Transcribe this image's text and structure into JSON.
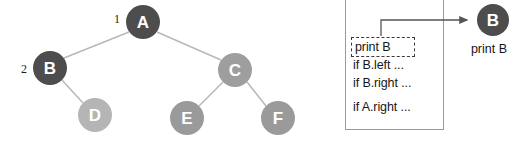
{
  "diagram": {
    "background_color": "#ffffff"
  },
  "tree": {
    "nodes": [
      {
        "id": "A",
        "label": "A",
        "cx": 143,
        "cy": 22,
        "r": 17,
        "color": "#4d4d4d",
        "state": "visited"
      },
      {
        "id": "B",
        "label": "B",
        "cx": 50,
        "cy": 68,
        "r": 17,
        "color": "#4d4d4d",
        "state": "visited"
      },
      {
        "id": "C",
        "label": "C",
        "cx": 235,
        "cy": 70,
        "r": 17,
        "color": "#9e9e9e",
        "state": "pending"
      },
      {
        "id": "D",
        "label": "D",
        "cx": 95,
        "cy": 115,
        "r": 17,
        "color": "#b5b5b5",
        "state": "pending"
      },
      {
        "id": "E",
        "label": "E",
        "cx": 187,
        "cy": 118,
        "r": 17,
        "color": "#9a9a9a",
        "state": "pending"
      },
      {
        "id": "F",
        "label": "F",
        "cx": 278,
        "cy": 118,
        "r": 17,
        "color": "#9a9a9a",
        "state": "pending"
      }
    ],
    "edges": [
      {
        "from": "A",
        "to": "B"
      },
      {
        "from": "A",
        "to": "C"
      },
      {
        "from": "B",
        "to": "D"
      },
      {
        "from": "C",
        "to": "E"
      },
      {
        "from": "C",
        "to": "F"
      }
    ],
    "edge_color": "#b9b9b9",
    "order_labels": [
      {
        "text": "1",
        "x": 117,
        "y": 19,
        "for_node": "A"
      },
      {
        "text": "2",
        "x": 24,
        "y": 69,
        "for_node": "B"
      }
    ]
  },
  "stack": {
    "lines": [
      {
        "text": "print B",
        "highlighted": true
      },
      {
        "text": "if B.left ...",
        "highlighted": false
      },
      {
        "text": "if B.right ...",
        "highlighted": false
      },
      {
        "text": "if A.right ...",
        "highlighted": false
      }
    ],
    "border_color": "#9a9a9a",
    "highlight_border_color": "#3a3a3a"
  },
  "output": {
    "node": {
      "label": "B",
      "cx": 153,
      "cy": 20,
      "r": 16,
      "color": "#4d4d4d"
    },
    "caption": "print B",
    "arrow_color": "#555555"
  }
}
